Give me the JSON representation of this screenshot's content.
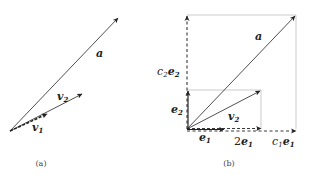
{
  "panels": [
    {
      "caption": "(a)",
      "vectors": [
        {
          "name": "a",
          "label": "a"
        },
        {
          "name": "v2",
          "label": "v",
          "sub": "2"
        },
        {
          "name": "v1",
          "label": "v",
          "sub": "1"
        }
      ]
    },
    {
      "caption": "(b)",
      "vectors": [
        {
          "name": "a",
          "label": "a"
        },
        {
          "name": "v2",
          "label": "v",
          "sub": "2"
        },
        {
          "name": "e1",
          "label": "e",
          "sub": "1"
        },
        {
          "name": "e2",
          "label": "e",
          "sub": "2"
        },
        {
          "name": "2e1",
          "prefix": "2",
          "label": "e",
          "sub": "1"
        },
        {
          "name": "c1e1",
          "prefix": "c",
          "prefix_sub": "1",
          "label": "e",
          "sub": "1"
        },
        {
          "name": "c2e2",
          "prefix": "c",
          "prefix_sub": "2",
          "label": "e",
          "sub": "2"
        }
      ]
    }
  ]
}
